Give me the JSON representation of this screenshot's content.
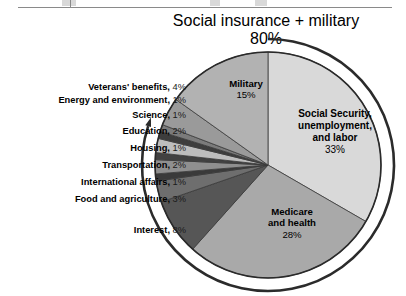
{
  "figure": {
    "top_rule_present": true,
    "header_line1": "Social insurance + military",
    "header_line2": "80%"
  },
  "chart_data": {
    "type": "pie",
    "title": "Social insurance + military",
    "subtitle": "80%",
    "total_percent": 100,
    "start_angle_deg": 0,
    "direction": "clockwise",
    "legend": "inline-labels",
    "grid": false,
    "categories": [
      "Social Security, unemployment, and labor",
      "Medicare and health",
      "Interest",
      "Food and agriculture",
      "International affairs",
      "Transportation",
      "Housing",
      "Education",
      "Science",
      "Energy and environment",
      "Veterans' benefits",
      "Military"
    ],
    "values": [
      33,
      28,
      8,
      3,
      1,
      2,
      1,
      2,
      1,
      1,
      4,
      15
    ],
    "colors": [
      "#d9d9d9",
      "#a9a9a9",
      "#565656",
      "#6e6e6e",
      "#3a3a3a",
      "#8f8f8f",
      "#414141",
      "#bdbdbd",
      "#3d3d3d",
      "#7b7b7b",
      "#9a9a9a",
      "#b2b2b2"
    ],
    "annotation": {
      "text": "Social insurance + military 80%",
      "arc_percent": 80,
      "arrow_direction": "counterclockwise"
    }
  },
  "pie_labels": [
    {
      "name": "Military",
      "percent": "15%"
    },
    {
      "name_line1": "Social Security,",
      "name_line2": "unemployment,",
      "name_line3": "and labor",
      "percent": "33%"
    },
    {
      "name_line1": "Medicare",
      "name_line2": "and health",
      "percent": "28%"
    }
  ],
  "callouts": [
    {
      "name": "Veterans' benefits,",
      "percent": "4%"
    },
    {
      "name": "Energy and environment,",
      "percent": "1%"
    },
    {
      "name": "Science,",
      "percent": "1%"
    },
    {
      "name": "Education,",
      "percent": "2%"
    },
    {
      "name": "Housing,",
      "percent": "1%"
    },
    {
      "name": "Transportation,",
      "percent": "2%"
    },
    {
      "name": "International affairs,",
      "percent": "1%"
    },
    {
      "name": "Food and agriculture,",
      "percent": "3%"
    },
    {
      "name": "Interest,",
      "percent": "8%"
    }
  ]
}
